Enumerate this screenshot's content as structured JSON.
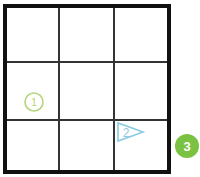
{
  "diagram": {
    "grid": {
      "rows": 3,
      "cols": 3,
      "border_color": "#111111",
      "line_color": "#333333"
    },
    "markers": [
      {
        "id": 1,
        "label": "1",
        "shape": "circle-outline",
        "row": 2,
        "col": 1,
        "color": "#b5d67a"
      },
      {
        "id": 2,
        "label": "2",
        "shape": "triangle-right-outline",
        "row": 3,
        "col": 3,
        "color": "#8ccbe0"
      },
      {
        "id": 3,
        "label": "3",
        "shape": "circle-filled",
        "position": "outside-right-bottom",
        "color": "#7cc242",
        "text_color": "#ffffff"
      }
    ]
  }
}
